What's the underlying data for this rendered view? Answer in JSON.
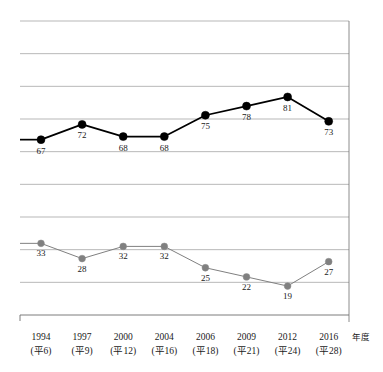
{
  "chart_data": {
    "type": "line",
    "title": "",
    "xlabel": "年度",
    "ylabel": "",
    "grid": true,
    "legend_position": "none",
    "ylim": [
      0,
      100
    ],
    "categories": [
      "1994",
      "1997",
      "2000",
      "2004",
      "2006",
      "2009",
      "2012",
      "2016"
    ],
    "category_sublabels": [
      "(平6)",
      "(平9)",
      "(平12)",
      "(平16)",
      "(平18)",
      "(平21)",
      "(平24)",
      "(平28)"
    ],
    "series": [
      {
        "name": "upper-series",
        "color": "#000000",
        "marker": "circle-filled",
        "values": [
          67,
          72,
          68,
          68,
          75,
          78,
          81,
          73
        ],
        "label_positions": [
          "below",
          "below",
          "below",
          "below",
          "below",
          "below",
          "below",
          "below"
        ]
      },
      {
        "name": "lower-series",
        "color": "#808080",
        "marker": "circle-filled",
        "values": [
          33,
          28,
          32,
          32,
          25,
          22,
          19,
          27
        ],
        "label_positions": [
          "below",
          "below",
          "below",
          "below",
          "below",
          "below",
          "below",
          "below"
        ]
      }
    ]
  },
  "axis": {
    "unit_label": "年度"
  },
  "colors": {
    "upper_line": "#000000",
    "lower_line": "#8c8c8c",
    "gridline": "#9a9a9a",
    "frame": "#6e6e6e",
    "text": "#1a1a1a"
  }
}
